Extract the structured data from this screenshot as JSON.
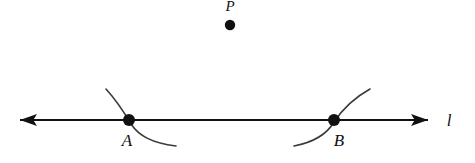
{
  "figure": {
    "type": "geometry-construction-diagram",
    "background_color": "#ffffff",
    "ink_color": "#111111",
    "arc_color": "#3a3a3a",
    "width": 475,
    "height": 163
  },
  "points": [
    {
      "id": "P",
      "label": "P",
      "label_position": "above",
      "dot": {
        "cx": 230,
        "cy": 25,
        "r": 5.2
      },
      "label_pos": {
        "x": 230,
        "y": 11
      },
      "on_line": false
    },
    {
      "id": "A",
      "label": "A",
      "label_position": "below-left",
      "dot": {
        "cx": 129,
        "cy": 120,
        "r": 6.0
      },
      "label_pos": {
        "x": 127,
        "y": 146
      },
      "on_line": true
    },
    {
      "id": "B",
      "label": "B",
      "label_position": "below-right",
      "dot": {
        "cx": 334,
        "cy": 120,
        "r": 6.0
      },
      "label_pos": {
        "x": 339,
        "y": 146
      },
      "on_line": true
    }
  ],
  "line": {
    "id": "l",
    "label": "l",
    "label_pos": {
      "x": 449,
      "y": 126
    },
    "y": 120,
    "x_start": 20,
    "x_end": 428,
    "stroke_width": 2.2,
    "arrowheads": [
      "left",
      "right"
    ],
    "arrowhead_length": 17,
    "arrowhead_halfwidth": 6
  },
  "arcs": [
    {
      "id": "arc-through-A",
      "through_point": "A",
      "description": "compass arc crossing line l at point A, sweeping from upper-left to lower-right",
      "path": "M 106,89 C 116,100 124,112 131,124 C 139,136 152,143 176,146",
      "stroke_width": 1.6
    },
    {
      "id": "arc-through-B",
      "through_point": "B",
      "description": "compass arc crossing line l at point B, sweeping from lower-left to upper-right",
      "path": "M 294,146 C 315,142 327,134 334,122 C 342,110 352,99 370,89",
      "stroke_width": 1.6
    }
  ]
}
